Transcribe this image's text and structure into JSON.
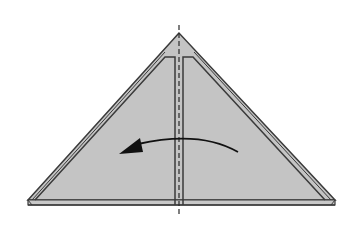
{
  "diagram": {
    "type": "origami-fold-step",
    "colors": {
      "paper": "#c4c4c4",
      "outline": "#3a3a3a",
      "crease": "#3a3a3a",
      "arrow": "#111111",
      "background": "#ffffff"
    },
    "shapes": {
      "outer_triangle": {
        "apex": [
          179,
          33
        ],
        "left": [
          28,
          201
        ],
        "right": [
          335,
          201
        ]
      },
      "base_strip_y": 205,
      "center_crease_x": 179,
      "inner_flap_top_y": 57
    },
    "arrow": {
      "direction": "right-to-left",
      "label": "fold-over-arrow"
    }
  }
}
